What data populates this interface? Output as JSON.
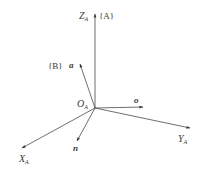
{
  "diagram": {
    "type": "coordinate-frames",
    "origin": {
      "label": "O",
      "sub": "A",
      "x": 95,
      "y": 108
    },
    "frame_A": {
      "name": "{A}",
      "axes": [
        {
          "id": "z",
          "label": "Z",
          "sub": "A",
          "end": [
            95,
            14
          ]
        },
        {
          "id": "y",
          "label": "Y",
          "sub": "A",
          "end": [
            190,
            128
          ]
        },
        {
          "id": "x",
          "label": "X",
          "sub": "A",
          "end": [
            22,
            148
          ]
        }
      ]
    },
    "frame_B": {
      "name": "{B}",
      "vectors": [
        {
          "id": "a",
          "label": "a",
          "end": [
            80,
            64
          ]
        },
        {
          "id": "o",
          "label": "o",
          "end": [
            143,
            107
          ]
        },
        {
          "id": "n",
          "label": "n",
          "end": [
            77,
            141
          ]
        }
      ]
    },
    "colors": {
      "line": "#4a4a4a",
      "text": "#3a3a3a",
      "background": "#ffffff"
    }
  },
  "labels": {
    "z_main": "Z",
    "z_sub": "A",
    "frame_a": "{A}",
    "frame_b": "{B}",
    "vec_a": "a",
    "vec_o": "o",
    "vec_n": "n",
    "origin_main": "O",
    "origin_sub": "A",
    "y_main": "Y",
    "y_sub": "A",
    "x_main": "X",
    "x_sub": "A"
  }
}
